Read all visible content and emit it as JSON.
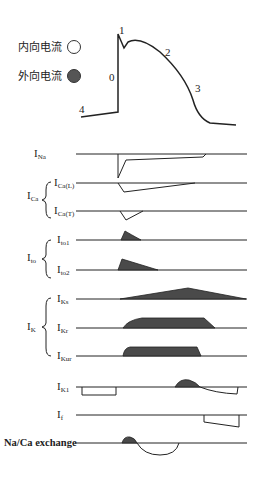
{
  "legend": {
    "inward_label": "内向电流",
    "outward_label": "外向电流"
  },
  "action_potential": {
    "phases": [
      "0",
      "1",
      "2",
      "3",
      "4"
    ]
  },
  "currents": [
    {
      "main": "I",
      "sub": "Na"
    },
    {
      "main": "I",
      "sub": "Ca(L)"
    },
    {
      "main": "I",
      "sub": "Ca(T)"
    },
    {
      "main": "I",
      "sub": "to1"
    },
    {
      "main": "I",
      "sub": "to2"
    },
    {
      "main": "I",
      "sub": "Ks"
    },
    {
      "main": "I",
      "sub": "Kr"
    },
    {
      "main": "I",
      "sub": "Kur"
    },
    {
      "main": "I",
      "sub": "K1"
    },
    {
      "main": "I",
      "sub": "f"
    }
  ],
  "groups": [
    {
      "main": "I",
      "sub": "Ca"
    },
    {
      "main": "I",
      "sub": "to"
    },
    {
      "main": "I",
      "sub": "K"
    }
  ],
  "exchanger_label": "Na/Ca exchange",
  "colors": {
    "fill": "#4a4a4a",
    "line": "#222222"
  }
}
